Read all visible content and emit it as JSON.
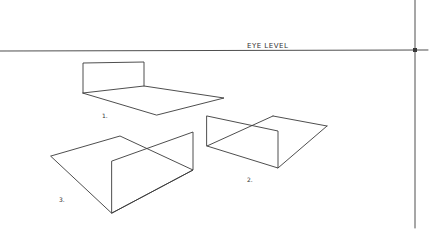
{
  "horizon_label": "EYE LEVEL",
  "figures": [
    {
      "id": "1",
      "label": "1."
    },
    {
      "id": "2",
      "label": "2."
    },
    {
      "id": "3",
      "label": "3."
    }
  ],
  "colors": {
    "line": "#3a3a3a",
    "background": "#ffffff"
  }
}
